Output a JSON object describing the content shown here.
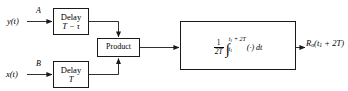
{
  "figure": {
    "type": "block-diagram",
    "background_color": "#ffffff",
    "line_color": "#1a1a1a"
  },
  "inputs": [
    {
      "id": "y",
      "signal_label": "y(t)",
      "branch_label": "A"
    },
    {
      "id": "x",
      "signal_label": "x(t)",
      "branch_label": "B"
    }
  ],
  "blocks": {
    "delay_top": {
      "line1": "Delay",
      "line2": "T − τ"
    },
    "delay_bottom": {
      "line1": "Delay",
      "line2": "T"
    },
    "product": {
      "label": "Product"
    },
    "integrator": {
      "fraction_numerator": "1",
      "fraction_denominator": "2T",
      "integral_symbol": "∫",
      "upper_limit": "t₁ + 2T",
      "upper_limit_base": "t",
      "upper_limit_sub": "1",
      "upper_limit_tail": " + 2T",
      "lower_limit_base": "t",
      "lower_limit_sub": "1",
      "integrand": "(·) dt",
      "full_expression": "(1/2T) ∫ from t₁ to t₁+2T of (·) dt"
    }
  },
  "output": {
    "label_base": "R",
    "label_sub": "o",
    "label_arg": "(t₁ + 2T)",
    "arg_base": "(t",
    "arg_sub": "1",
    "arg_tail": " + 2T)",
    "full_label": "Rₒ(t₁ + 2T)"
  }
}
